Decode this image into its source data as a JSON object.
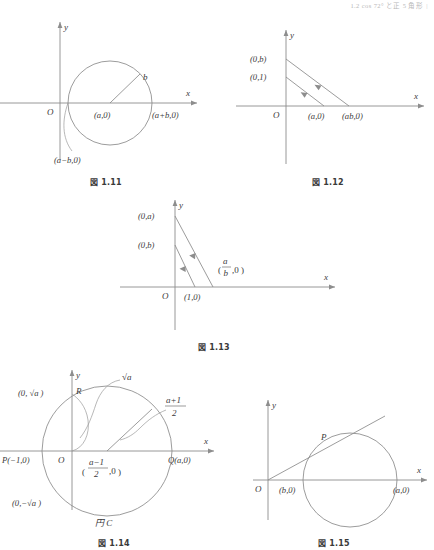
{
  "header": {
    "text": "1.2  cos 72° と正 5 角形",
    "rule": "|"
  },
  "figures": [
    {
      "id": "fig-1-11",
      "caption": "図 1.11",
      "axis_x": "x",
      "axis_y": "y",
      "origin": "O",
      "labels": {
        "center": "(a,0)",
        "radius": "b",
        "right_point": "(a+b,0)",
        "left_point": "(a−b,0)"
      }
    },
    {
      "id": "fig-1-12",
      "caption": "図 1.12",
      "axis_x": "x",
      "axis_y": "y",
      "origin": "O",
      "labels": {
        "y_b": "(0,b)",
        "y_1": "(0,1)",
        "x_a": "(a,0)",
        "x_ab": "(ab,0)"
      }
    },
    {
      "id": "fig-1-13",
      "caption": "図 1.13",
      "axis_x": "x",
      "axis_y": "y",
      "origin": "O",
      "labels": {
        "y_a": "(0,a)",
        "y_b": "(0,b)",
        "x_1": "(1,0)",
        "x_ab_num": "a",
        "x_ab_den": "b",
        "x_ab_tail": ",0"
      }
    },
    {
      "id": "fig-1-14",
      "caption": "図 1.14",
      "axis_x": "x",
      "axis_y": "y",
      "origin": "O",
      "labels": {
        "p_left": "P(−1,0)",
        "q_right": "Q(a,0)",
        "r_top": "R",
        "y_pos_sqrt": "(0, √a )",
        "y_neg_sqrt": "(0,−√a )",
        "sqrt_a": "√a",
        "center_num": "a−1",
        "center_den": "2",
        "center_tail": ",0",
        "radius_num": "a+1",
        "radius_den": "2",
        "circle_name": "円 C"
      }
    },
    {
      "id": "fig-1-15",
      "caption": "図 1.15",
      "axis_x": "x",
      "axis_y": "y",
      "origin": "O",
      "labels": {
        "tangent_point": "P",
        "x_b": "(b,0)",
        "x_a": "(a,0)"
      }
    }
  ],
  "colors": {
    "ink": "#3a3a3a",
    "line": "#8a8a8a",
    "axis": "#8d8d8d",
    "header": "#b8b8b8",
    "paper": "#ffffff"
  }
}
